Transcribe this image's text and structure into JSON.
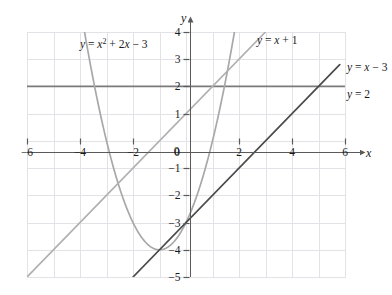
{
  "chart_data": {
    "type": "line",
    "title": "",
    "xlabel": "x",
    "ylabel": "y",
    "xlim": [
      -6,
      6
    ],
    "ylim": [
      -5,
      4
    ],
    "grid": true,
    "grid_step": 1,
    "legend": "inline-curve-labels",
    "x_ticks": [
      "-6",
      "-4",
      "-2",
      "0",
      "2",
      "4",
      "6"
    ],
    "x_tick_values": [
      -6,
      -4,
      -2,
      0,
      2,
      4,
      6
    ],
    "y_ticks": [
      "4",
      "3",
      "2",
      "1",
      "0",
      "-1",
      "-2",
      "-3",
      "-4",
      "-5"
    ],
    "y_tick_values": [
      4,
      3,
      2,
      1,
      0,
      -1,
      -2,
      -3,
      -4,
      -5
    ],
    "series": [
      {
        "name": "parabola",
        "label": "y = x² + 2x − 3",
        "type": "quadratic",
        "equation": "y = x^2 + 2x - 3",
        "a": 1,
        "b": 2,
        "c": -3,
        "vertex": [
          -1,
          -4
        ],
        "roots": [
          -3,
          1
        ],
        "y_intercept": -3,
        "color": "#a8a8a8",
        "x_domain": [
          -3.85,
          1.85
        ],
        "points": [
          [
            -3.85,
            5.12
          ],
          [
            -3.5,
            2.25
          ],
          [
            -3.0,
            0.0
          ],
          [
            -2.5,
            -1.75
          ],
          [
            -2.0,
            -3.0
          ],
          [
            -1.5,
            -3.75
          ],
          [
            -1.0,
            -4.0
          ],
          [
            -0.5,
            -3.75
          ],
          [
            0.0,
            -3.0
          ],
          [
            0.5,
            -1.75
          ],
          [
            1.0,
            0.0
          ],
          [
            1.5,
            2.25
          ],
          [
            1.85,
            4.12
          ]
        ]
      },
      {
        "name": "line-x-plus-1",
        "label": "y = x + 1",
        "type": "linear",
        "equation": "y = x + 1",
        "slope": 1,
        "intercept": 1,
        "color": "#b0b0b0",
        "x_domain": [
          -6.0,
          3.0
        ],
        "points": [
          [
            -6.0,
            -5.0
          ],
          [
            3.0,
            4.0
          ]
        ]
      },
      {
        "name": "line-x-minus-3",
        "label": "y = x − 3",
        "type": "linear",
        "equation": "y = x - 3",
        "slope": 1,
        "intercept": -3,
        "color": "#4a4a4a",
        "x_domain": [
          -2.0,
          5.8
        ],
        "points": [
          [
            -2.0,
            -5.0
          ],
          [
            5.8,
            2.8
          ]
        ]
      },
      {
        "name": "line-y-equals-2",
        "label": "y = 2",
        "type": "horizontal",
        "equation": "y = 2",
        "value": 2,
        "color": "#7a7a7a",
        "x_domain": [
          -6.0,
          6.0
        ],
        "points": [
          [
            -6.0,
            2.0
          ],
          [
            6.0,
            2.0
          ]
        ]
      }
    ],
    "annotations": [
      {
        "name": "parabola-label",
        "text": "y = x² + 2x − 3",
        "at": [
          -2.6,
          3.45
        ]
      },
      {
        "name": "line-x-plus-1-label",
        "text": "y = x + 1",
        "at": [
          2.35,
          3.45
        ]
      },
      {
        "name": "line-x-minus-3-label",
        "text": "y = x − 3",
        "at": [
          6.15,
          2.9
        ]
      },
      {
        "name": "line-y-equals-2-label",
        "text": "y = 2",
        "at": [
          6.15,
          1.95
        ]
      }
    ]
  },
  "axes": {
    "x_axis_name": "x",
    "y_axis_name": "y",
    "x_tick_labels": [
      "-6",
      "-4",
      "-2",
      "0",
      "2",
      "4",
      "6"
    ],
    "y_tick_labels": [
      "4",
      "3",
      "2",
      "1",
      "0",
      "-1",
      "-2",
      "-3",
      "-4",
      "-5"
    ]
  },
  "labels": {
    "parabola": "y = x",
    "parabola_exp": "2",
    "parabola_rest": "+ 2x − 3",
    "line_a": "y = x + 1",
    "line_b": "y = x − 3",
    "line_c": "y = 2"
  },
  "colors": {
    "background": "#ffffff",
    "grid": "#e2e2e6",
    "plot_border": "#e2e2e6",
    "axis": "#5a5a5a",
    "parabola": "#a8a8a8",
    "line_x_plus_1": "#b0b0b0",
    "line_x_minus_3": "#4a4a4a",
    "line_y_2": "#7a7a7a",
    "text": "#1a1a1a"
  }
}
